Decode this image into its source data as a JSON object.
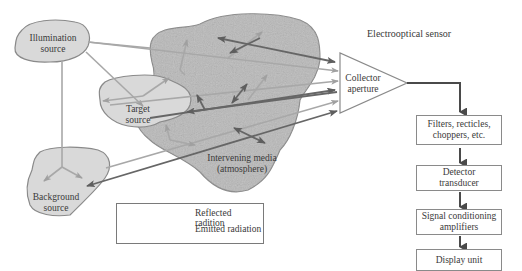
{
  "diagram": {
    "title": "Electrooptical sensor",
    "nodes": {
      "illumination": {
        "line1": "Illumination",
        "line2": "source"
      },
      "target": {
        "line1": "Target",
        "line2": "source"
      },
      "background": {
        "line1": "Background",
        "line2": "source"
      },
      "media": {
        "line1": "Intervening media",
        "line2": "(atmosphere)"
      },
      "collector": {
        "line1": "Collector",
        "line2": "aperture"
      }
    },
    "chain": [
      {
        "line1": "Filters, recticles,",
        "line2": "choppers, etc."
      },
      {
        "line1": "Detector",
        "line2": "transducer"
      },
      {
        "line1": "Signal conditioning",
        "line2": "amplifiers"
      },
      {
        "line1": "Display unit",
        "line2": ""
      }
    ],
    "legend": [
      {
        "label": "Reflected radition",
        "color": "#a8a8a8"
      },
      {
        "label": "Emitted radiation",
        "color": "#666666"
      }
    ],
    "colors": {
      "blob_fill": "#d9d9d9",
      "media_fill": "#b8b8b8",
      "outline": "#8a8a8a",
      "reflected": "#a8a8a8",
      "emitted": "#666666"
    }
  }
}
